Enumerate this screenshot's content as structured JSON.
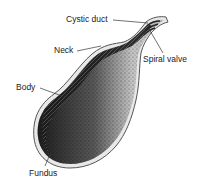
{
  "diagram": {
    "labels": [
      {
        "id": "cystic-duct",
        "text": "Cystic duct"
      },
      {
        "id": "neck",
        "text": "Neck"
      },
      {
        "id": "spiral-valve",
        "text": "Spiral valve"
      },
      {
        "id": "body",
        "text": "Body"
      },
      {
        "id": "fundus",
        "text": "Fundus"
      }
    ]
  },
  "colors": {
    "outline": "#555555",
    "dark_tissue": "#1a1a1a",
    "light_tissue": "#b8b8b8",
    "background": "#ffffff"
  }
}
